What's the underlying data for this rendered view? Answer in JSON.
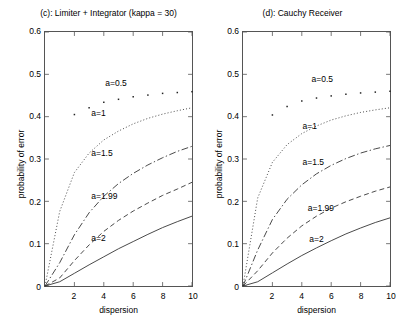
{
  "figure": {
    "axis_title_x": "dispersion",
    "axis_title_y": "probability of error"
  },
  "chart_data": [
    {
      "type": "line",
      "panel_id": "c",
      "title": "(c): Limiter + Integrator (kappa = 30)",
      "xlabel": "dispersion",
      "ylabel": "probability of error",
      "xlim": [
        0,
        10
      ],
      "ylim": [
        0,
        0.6
      ],
      "xticks": [
        0,
        2,
        4,
        6,
        8,
        10
      ],
      "xticklabels": [
        "0",
        "2",
        "4",
        "6",
        "8",
        "10"
      ],
      "yticks": [
        0,
        0.1,
        0.2,
        0.3,
        0.4,
        0.5,
        0.6
      ],
      "yticklabels": [
        "0",
        "0.1",
        "0.2",
        "0.3",
        "0.4",
        "0.5",
        "0.6"
      ],
      "grid": false,
      "legend": "inline-annotations",
      "x": [
        1,
        2,
        3,
        4,
        5,
        6,
        7,
        8,
        9,
        10
      ],
      "series": [
        {
          "name": "a=0.5",
          "style": "markers",
          "label": "a=0.5",
          "label_x": 4.05,
          "label_y": 0.477,
          "x": [
            2,
            3,
            4,
            5,
            6,
            7,
            8,
            9,
            10
          ],
          "values": [
            0.405,
            0.421,
            0.434,
            0.441,
            0.447,
            0.451,
            0.455,
            0.457,
            0.459
          ]
        },
        {
          "name": "a=1",
          "style": "dotted",
          "label": "a=1",
          "label_x": 3.1,
          "label_y": 0.408,
          "values": [
            0.176,
            0.268,
            0.314,
            0.345,
            0.366,
            0.383,
            0.396,
            0.406,
            0.414,
            0.421
          ]
        },
        {
          "name": "a=1.5",
          "style": "dashdot",
          "label": "a=1.5",
          "label_x": 3.1,
          "label_y": 0.313,
          "values": [
            0.055,
            0.121,
            0.173,
            0.212,
            0.242,
            0.266,
            0.286,
            0.303,
            0.318,
            0.33
          ]
        },
        {
          "name": "a=1.99",
          "style": "dashed",
          "label": "a=1.99",
          "label_x": 3.1,
          "label_y": 0.213,
          "values": [
            0.019,
            0.06,
            0.097,
            0.129,
            0.155,
            0.177,
            0.196,
            0.214,
            0.229,
            0.245
          ]
        },
        {
          "name": "a=2",
          "style": "solid",
          "label": "a=2",
          "label_x": 3.1,
          "label_y": 0.115,
          "values": [
            0.01,
            0.03,
            0.05,
            0.069,
            0.088,
            0.105,
            0.122,
            0.138,
            0.152,
            0.165
          ]
        }
      ]
    },
    {
      "type": "line",
      "panel_id": "d",
      "title": "(d): Cauchy Receiver",
      "xlabel": "dispersion",
      "ylabel": "probability of error",
      "xlim": [
        0,
        10
      ],
      "ylim": [
        0,
        0.6
      ],
      "xticks": [
        0,
        2,
        4,
        6,
        8,
        10
      ],
      "xticklabels": [
        "0",
        "2",
        "4",
        "6",
        "8",
        "10"
      ],
      "yticks": [
        0,
        0.1,
        0.2,
        0.3,
        0.4,
        0.5,
        0.6
      ],
      "yticklabels": [
        "0",
        "0.1",
        "0.2",
        "0.3",
        "0.4",
        "0.5",
        "0.6"
      ],
      "grid": false,
      "legend": "inline-annotations",
      "x": [
        1,
        2,
        3,
        4,
        5,
        6,
        7,
        8,
        9,
        10
      ],
      "series": [
        {
          "name": "a=0.5",
          "style": "markers",
          "label": "a=0.5",
          "label_x": 4.6,
          "label_y": 0.487,
          "x": [
            2,
            3,
            4,
            5,
            6,
            7,
            8,
            9,
            10
          ],
          "values": [
            0.404,
            0.424,
            0.437,
            0.444,
            0.449,
            0.453,
            0.456,
            0.458,
            0.46
          ]
        },
        {
          "name": "a=1",
          "style": "dotted",
          "label": "a=1",
          "label_x": 4.0,
          "label_y": 0.378,
          "values": [
            0.208,
            0.292,
            0.334,
            0.36,
            0.378,
            0.392,
            0.402,
            0.41,
            0.416,
            0.421
          ]
        },
        {
          "name": "a=1.5",
          "style": "dashdot",
          "label": "a=1.5",
          "label_x": 4.0,
          "label_y": 0.293,
          "values": [
            0.085,
            0.157,
            0.205,
            0.239,
            0.265,
            0.285,
            0.301,
            0.314,
            0.324,
            0.332
          ]
        },
        {
          "name": "a=1.99",
          "style": "dashed",
          "label": "a=1.99",
          "label_x": 4.35,
          "label_y": 0.186,
          "values": [
            0.036,
            0.078,
            0.113,
            0.142,
            0.165,
            0.184,
            0.199,
            0.212,
            0.224,
            0.234
          ]
        },
        {
          "name": "a=2",
          "style": "solid",
          "label": "a=2",
          "label_x": 4.45,
          "label_y": 0.113,
          "values": [
            0.01,
            0.031,
            0.052,
            0.072,
            0.09,
            0.107,
            0.123,
            0.137,
            0.15,
            0.161
          ]
        }
      ]
    }
  ]
}
